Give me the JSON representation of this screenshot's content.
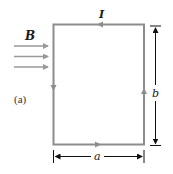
{
  "figure": {
    "panel_label": "(a)",
    "current_label": "I",
    "field_label": "B",
    "width_label": "a",
    "height_label": "b"
  },
  "colors": {
    "loop": "#8c8c8c",
    "field_arrows": "#999999",
    "dimension_lines": "#111111",
    "text": "#1a1a1a"
  },
  "loop": {
    "shape": "rectangle",
    "current_direction": "counterclockwise",
    "field_direction": "left-to-right"
  }
}
